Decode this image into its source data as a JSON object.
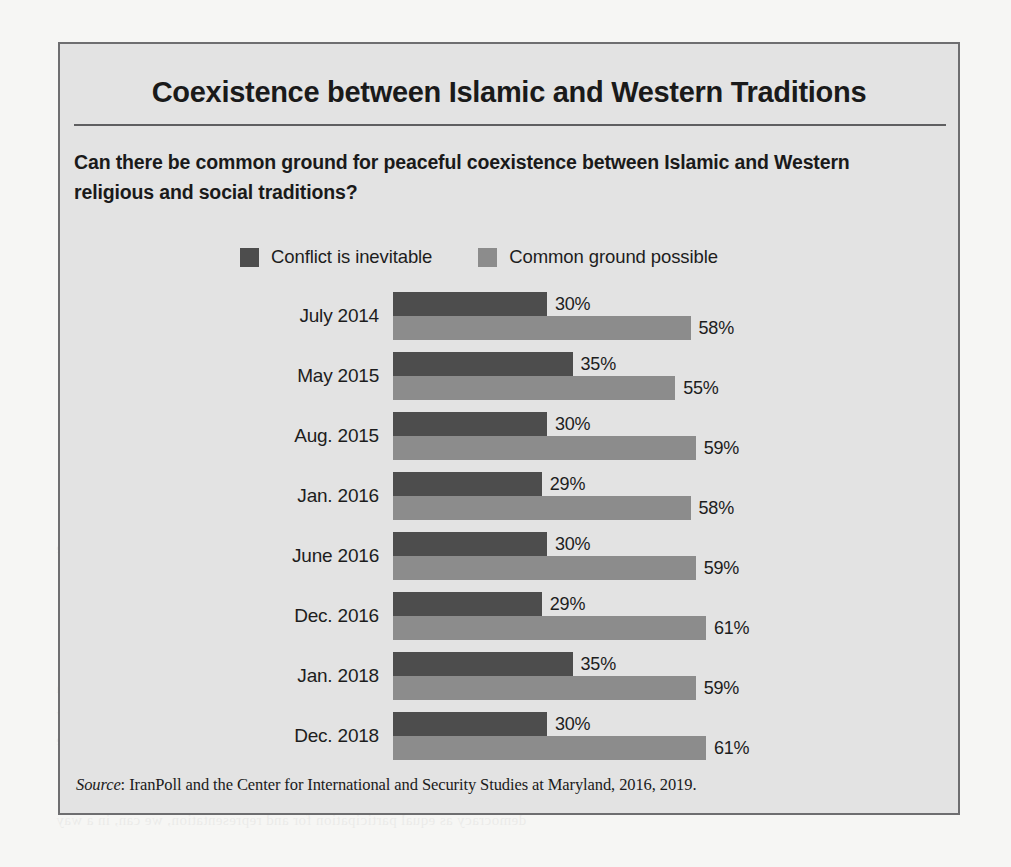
{
  "figure": {
    "title": "Coexistence between Islamic and Western Traditions",
    "subtitle": "Can there be common ground for peaceful coexistence between Islamic and Western religious and social traditions?",
    "source_prefix": "Source",
    "source_separator": ": ",
    "source_text": "IranPoll and the Center for International and Security Studies at Maryland, 2016, 2019."
  },
  "colors": {
    "series_conflict": "#4d4d4d",
    "series_common": "#8c8c8c",
    "panel_background": "#e3e3e3",
    "panel_border": "#6e6e70",
    "page_background": "#f6f6f4",
    "rule": "#5f5f61",
    "text": "#1a1a1a"
  },
  "chart_data": {
    "type": "bar",
    "orientation": "horizontal",
    "title": "Coexistence between Islamic and Western Traditions",
    "subtitle": "Can there be common ground for peaceful coexistence between Islamic and Western religious and social traditions?",
    "xlabel": "",
    "ylabel": "",
    "xlim": [
      0,
      100
    ],
    "grid": false,
    "legend_position": "top",
    "value_suffix": "%",
    "categories": [
      "July 2014",
      "May 2015",
      "Aug. 2015",
      "Jan. 2016",
      "June 2016",
      "Dec. 2016",
      "Jan. 2018",
      "Dec. 2018"
    ],
    "series": [
      {
        "name": "Conflict is inevitable",
        "color": "#4d4d4d",
        "values": [
          30,
          35,
          30,
          29,
          30,
          29,
          35,
          30
        ],
        "labels": [
          "30%",
          "35%",
          "30%",
          "29%",
          "30%",
          "29%",
          "35%",
          "30%"
        ]
      },
      {
        "name": "Common ground possible",
        "color": "#8c8c8c",
        "values": [
          58,
          55,
          59,
          58,
          59,
          61,
          59,
          61
        ],
        "labels": [
          "58%",
          "55%",
          "59%",
          "58%",
          "59%",
          "61%",
          "59%",
          "61%"
        ]
      }
    ]
  },
  "ghost_text": [
    {
      "text": "the United St",
      "x": 700,
      "y": 78
    },
    {
      "text": "peace",
      "x": 60,
      "y": 352
    },
    {
      "text": "is inevitable",
      "x": 58,
      "y": 432
    },
    {
      "text": "ground possible",
      "x": 56,
      "y": 540
    },
    {
      "text": "Less than a fourth of Iranians (24 percent)",
      "x": 300,
      "y": 570
    },
    {
      "text": "final future revolution in the country, a complete rejection",
      "x": 56,
      "y": 680
    },
    {
      "text": "ing with the West. However, most Iranians are legally",
      "x": 56,
      "y": 706
    },
    {
      "text": "related and a fraction of the country in a considerable",
      "x": 56,
      "y": 732
    },
    {
      "text": "democracy as equal participation for and representation, we can, in a way",
      "x": 56,
      "y": 812
    }
  ]
}
